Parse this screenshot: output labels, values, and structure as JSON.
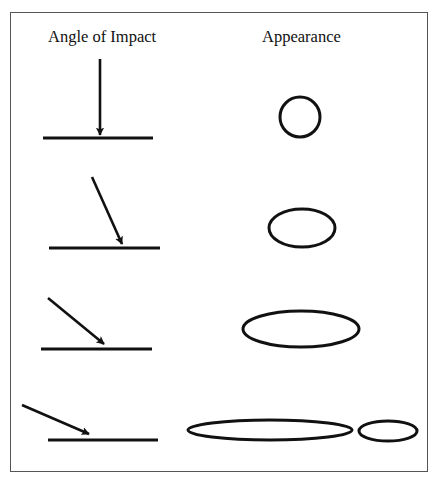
{
  "headings": {
    "left": "Angle of Impact",
    "right": "Appearance"
  },
  "colors": {
    "stroke": "#111111",
    "frame": "#555555",
    "background": "#ffffff"
  },
  "rows": [
    {
      "impact_angle_deg": 90,
      "arrow": {
        "x1": 100,
        "y1": 59,
        "x2": 100,
        "y2": 135
      },
      "surface": {
        "x1": 43,
        "y1": 138,
        "x2": 153,
        "y2": 138
      },
      "stains": [
        {
          "cx": 300,
          "cy": 117,
          "rx": 20,
          "ry": 20
        }
      ]
    },
    {
      "impact_angle_deg": 66,
      "arrow": {
        "x1": 92,
        "y1": 177,
        "x2": 122,
        "y2": 244
      },
      "surface": {
        "x1": 49,
        "y1": 248,
        "x2": 160,
        "y2": 248
      },
      "stains": [
        {
          "cx": 302,
          "cy": 228,
          "rx": 33,
          "ry": 19
        }
      ]
    },
    {
      "impact_angle_deg": 39,
      "arrow": {
        "x1": 48,
        "y1": 298,
        "x2": 104,
        "y2": 344
      },
      "surface": {
        "x1": 41,
        "y1": 349,
        "x2": 152,
        "y2": 349
      },
      "stains": [
        {
          "cx": 301,
          "cy": 329,
          "rx": 58,
          "ry": 18
        }
      ]
    },
    {
      "impact_angle_deg": 23,
      "arrow": {
        "x1": 22,
        "y1": 405,
        "x2": 89,
        "y2": 434
      },
      "surface": {
        "x1": 48,
        "y1": 440,
        "x2": 158,
        "y2": 440
      },
      "stains": [
        {
          "cx": 270,
          "cy": 430,
          "rx": 82,
          "ry": 10
        },
        {
          "cx": 388,
          "cy": 431,
          "rx": 29,
          "ry": 10
        }
      ]
    }
  ]
}
